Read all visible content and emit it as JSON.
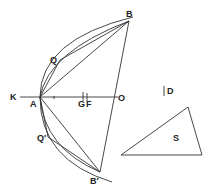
{
  "diagram": {
    "labels": {
      "K": "K",
      "A": "A",
      "Q": "Q",
      "Q_prime": "Q′",
      "B": "B",
      "B_prime": "B′",
      "O": "O",
      "G": "G",
      "F": "F",
      "D": "D",
      "S": "S"
    },
    "points": {
      "K": [
        20,
        97
      ],
      "A": [
        40,
        97
      ],
      "Q": [
        60,
        60
      ],
      "Q_prime": [
        48,
        137
      ],
      "B": [
        129,
        21
      ],
      "B_prime": [
        100,
        172
      ],
      "O": [
        115,
        97
      ],
      "G": [
        83,
        97
      ],
      "F": [
        87,
        97
      ]
    },
    "triangle_S": [
      [
        121,
        155
      ],
      [
        188,
        107
      ],
      [
        202,
        155
      ]
    ],
    "stroke_color": "#333333"
  }
}
